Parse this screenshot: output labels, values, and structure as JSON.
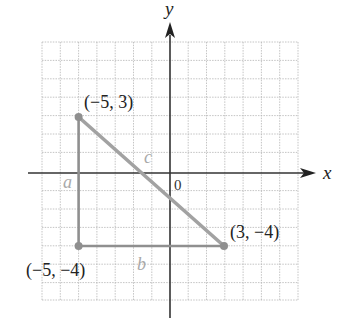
{
  "figure": {
    "axes": {
      "x_label": "x",
      "y_label": "y",
      "origin_label": "0",
      "grid_range_x": [
        -7,
        7
      ],
      "grid_range_y": [
        -7,
        7
      ]
    },
    "points": [
      {
        "label": "(−5, 3)",
        "x": -5,
        "y": 3
      },
      {
        "label": "(−5, −4)",
        "x": -5,
        "y": -4
      },
      {
        "label": "(3, −4)",
        "x": 3,
        "y": -4
      }
    ],
    "sides": [
      {
        "label": "a",
        "from": [
          -5,
          3
        ],
        "to": [
          -5,
          -4
        ]
      },
      {
        "label": "b",
        "from": [
          -5,
          -4
        ],
        "to": [
          3,
          -4
        ]
      },
      {
        "label": "c",
        "from": [
          -5,
          3
        ],
        "to": [
          3,
          -4
        ]
      }
    ],
    "colors": {
      "grid": "#b5b5b5",
      "axis": "#333333",
      "triangle": "#8f8f8f",
      "side_label": "#a9a9a9",
      "text": "#222222"
    }
  }
}
